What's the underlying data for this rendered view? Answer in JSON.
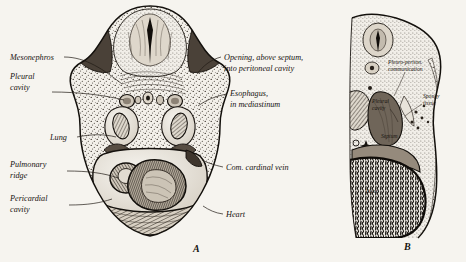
{
  "figure": {
    "background_color": "#f6f4ef",
    "ink_color": "#17130f"
  },
  "panels": [
    {
      "id": "A",
      "letter": "A",
      "letter_pos": {
        "x": 193,
        "y": 252
      },
      "description": "Transverse section through embryo thorax"
    },
    {
      "id": "B",
      "letter": "B",
      "letter_pos": {
        "x": 404,
        "y": 250
      },
      "description": "Parasagittal section showing pleuroperitoneal communication"
    }
  ],
  "labels_panel_a": [
    {
      "name": "mesonephros",
      "lines": [
        "Mesonephros"
      ],
      "x": 10,
      "y": 60,
      "anchor": "start",
      "leader": "M 64,57 C 86,57 104,70 122,84"
    },
    {
      "name": "pleural-cavity",
      "lines": [
        "Pleural",
        "cavity"
      ],
      "x": 10,
      "y": 79,
      "anchor": "start",
      "leader": "M 52,92 C 78,92 104,95 124,100"
    },
    {
      "name": "lung",
      "lines": [
        "Lung"
      ],
      "x": 50,
      "y": 140,
      "anchor": "start",
      "leader": "M 77,137 C 92,134 104,134 116,137"
    },
    {
      "name": "pulmonary-ridge",
      "lines": [
        "Pulmonary",
        "ridge"
      ],
      "x": 10,
      "y": 167,
      "anchor": "start",
      "leader": "M 67,171 C 88,171 104,173 118,178"
    },
    {
      "name": "pericardial-cavity",
      "lines": [
        "Pericardial",
        "cavity"
      ],
      "x": 10,
      "y": 201,
      "anchor": "start",
      "leader": "M 69,205 C 88,205 100,203 112,199"
    },
    {
      "name": "opening-above-septum",
      "lines": [
        "Opening, above septum,",
        "into peritoneal cavity"
      ],
      "x": 224,
      "y": 60,
      "anchor": "start",
      "leader": "M 221,57 C 210,60 203,66 197,74"
    },
    {
      "name": "esophagus-in-mediastinum",
      "lines": [
        "Esophagus,",
        "in mediastinum"
      ],
      "x": 230,
      "y": 96,
      "anchor": "start",
      "leader": "M 227,94 C 216,96 206,100 198,106"
    },
    {
      "name": "com-cardinal-vein",
      "lines": [
        "Com. cardinal vein"
      ],
      "x": 226,
      "y": 170,
      "anchor": "start",
      "leader": "M 223,167 C 214,165 208,163 202,160"
    },
    {
      "name": "heart",
      "lines": [
        "Heart"
      ],
      "x": 226,
      "y": 217,
      "anchor": "start",
      "leader": "M 223,214 C 215,213 209,210 203,206"
    }
  ],
  "labels_panel_b": [
    {
      "name": "pleuro-peritoneal-communication",
      "lines": [
        "Pleuro-periton.",
        "communication"
      ],
      "x": 388,
      "y": 64,
      "anchor": "start",
      "leader": "M 405,72 C 402,80 398,88 394,96"
    },
    {
      "name": "spongy-tissue",
      "lines": [
        "Spongy",
        "tissue"
      ],
      "x": 423,
      "y": 98,
      "anchor": "start",
      "leader": "M 422,104 C 416,108 410,112 405,116"
    },
    {
      "name": "pleural-cavity-b",
      "lines": [
        "Pleural",
        "cavity"
      ],
      "x": 372,
      "y": 103,
      "anchor": "start",
      "leader": "M 390,109 C 394,114 396,118 398,122"
    },
    {
      "name": "septum",
      "lines": [
        "Septum"
      ],
      "x": 381,
      "y": 138,
      "anchor": "start",
      "leader": ""
    },
    {
      "name": "liver",
      "lines": [
        "Liver"
      ],
      "x": 366,
      "y": 193,
      "anchor": "start",
      "leader": ""
    }
  ]
}
